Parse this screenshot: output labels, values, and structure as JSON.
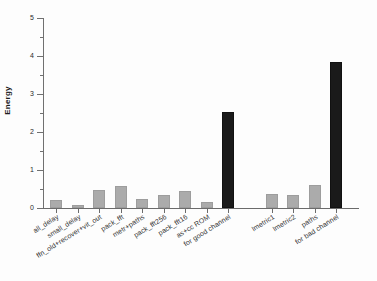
{
  "chart_data": {
    "type": "bar",
    "title": "",
    "subtitle": "",
    "xlabel": "",
    "ylabel": "Energy",
    "ylim": [
      0,
      5
    ],
    "yticks": [
      0,
      1,
      2,
      3,
      4,
      5
    ],
    "ytick_labels": [
      "0",
      "1",
      "2",
      "3",
      "4",
      "5"
    ],
    "grid": false,
    "legend": "none",
    "orientation": "vertical",
    "label_rotation_deg": -32,
    "categories": [
      "all_delay",
      "small_delay",
      "ffn_old+recover+vit_out",
      "pack_fft",
      "metr+paths",
      "pack_fft256",
      "pack_fft16",
      "as+cc ROM",
      "for good channel",
      "lmetric1",
      "lmetric2",
      "paths",
      "for bad channel"
    ],
    "values": [
      0.2,
      0.07,
      0.48,
      0.57,
      0.24,
      0.34,
      0.46,
      0.15,
      2.53,
      0.36,
      0.35,
      0.6,
      3.83
    ],
    "bar_colors": [
      "#ababab",
      "#ababab",
      "#ababab",
      "#ababab",
      "#ababab",
      "#ababab",
      "#ababab",
      "#ababab",
      "#1a1a1a",
      "#ababab",
      "#ababab",
      "#ababab",
      "#1a1a1a"
    ],
    "series": [
      {
        "name": "Energy",
        "values": [
          0.2,
          0.07,
          0.48,
          0.57,
          0.24,
          0.34,
          0.46,
          0.15,
          2.53,
          0.36,
          0.35,
          0.6,
          3.83
        ]
      }
    ],
    "groups": [
      {
        "name": "good channel",
        "category_indices": [
          0,
          1,
          2,
          3,
          4,
          5,
          6,
          7,
          8
        ],
        "total_index": 8
      },
      {
        "name": "bad channel",
        "category_indices": [
          9,
          10,
          11,
          12
        ],
        "total_index": 12
      }
    ],
    "group_gap_after_index": 8
  },
  "colors": {
    "bar_gray": "#ababab",
    "bar_black": "#1a1a1a",
    "axis": "#6e6e6e",
    "text": "#2f2f2f",
    "background": "#fdfdfd"
  }
}
